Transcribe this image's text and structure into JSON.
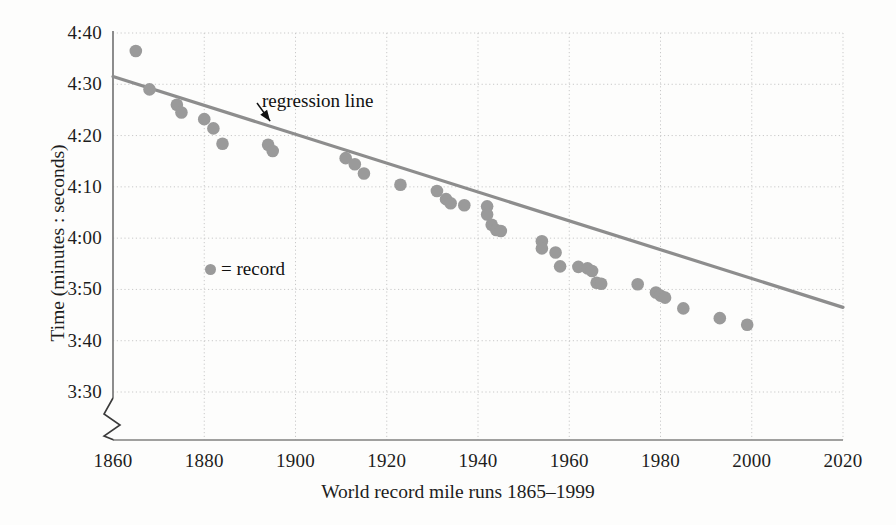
{
  "chart_data": {
    "type": "scatter",
    "title": "",
    "xlabel": "World record mile runs 1865–1999",
    "ylabel": "Time (minutes : seconds)",
    "xlim": [
      1860,
      2020
    ],
    "ylim_seconds": [
      210,
      280
    ],
    "xticks": [
      1860,
      1880,
      1900,
      1920,
      1940,
      1960,
      1980,
      2000,
      2020
    ],
    "yticks": [
      "3:30",
      "3:40",
      "3:50",
      "4:00",
      "4:10",
      "4:20",
      "4:30",
      "4:40"
    ],
    "ytick_seconds": [
      210,
      220,
      230,
      240,
      250,
      260,
      270,
      280
    ],
    "grid": true,
    "y_axis_break": true,
    "legend": {
      "position": "inside-left",
      "marker": "filled-circle",
      "entries": [
        {
          "label": "= record",
          "color": "#9a9a9a"
        }
      ]
    },
    "annotations": [
      {
        "text": "regression line",
        "x": 1920,
        "y_seconds": 266,
        "arrow_to_x": 1894,
        "arrow_to_y_seconds": 263
      }
    ],
    "series": [
      {
        "name": "record",
        "color": "#9a9a9a",
        "marker": "circle",
        "points": [
          {
            "x": 1865,
            "time": "4:36.5",
            "seconds": 276.5
          },
          {
            "x": 1868,
            "time": "4:29.0",
            "seconds": 269.0
          },
          {
            "x": 1874,
            "time": "4:26.0",
            "seconds": 266.0
          },
          {
            "x": 1875,
            "time": "4:24.5",
            "seconds": 264.5
          },
          {
            "x": 1880,
            "time": "4:23.2",
            "seconds": 263.2
          },
          {
            "x": 1882,
            "time": "4:21.4",
            "seconds": 261.4
          },
          {
            "x": 1884,
            "time": "4:18.4",
            "seconds": 258.4
          },
          {
            "x": 1894,
            "time": "4:18.2",
            "seconds": 258.2
          },
          {
            "x": 1895,
            "time": "4:17.0",
            "seconds": 257.0
          },
          {
            "x": 1911,
            "time": "4:15.6",
            "seconds": 255.6
          },
          {
            "x": 1913,
            "time": "4:14.4",
            "seconds": 254.4
          },
          {
            "x": 1915,
            "time": "4:12.6",
            "seconds": 252.6
          },
          {
            "x": 1923,
            "time": "4:10.4",
            "seconds": 250.4
          },
          {
            "x": 1931,
            "time": "4:09.2",
            "seconds": 249.2
          },
          {
            "x": 1933,
            "time": "4:07.6",
            "seconds": 247.6
          },
          {
            "x": 1934,
            "time": "4:06.8",
            "seconds": 246.8
          },
          {
            "x": 1937,
            "time": "4:06.4",
            "seconds": 246.4
          },
          {
            "x": 1942,
            "time": "4:06.2",
            "seconds": 246.2
          },
          {
            "x": 1942,
            "time": "4:04.6",
            "seconds": 244.6
          },
          {
            "x": 1943,
            "time": "4:02.6",
            "seconds": 242.6
          },
          {
            "x": 1944,
            "time": "4:01.6",
            "seconds": 241.6
          },
          {
            "x": 1945,
            "time": "4:01.4",
            "seconds": 241.4
          },
          {
            "x": 1954,
            "time": "3:59.4",
            "seconds": 239.4
          },
          {
            "x": 1954,
            "time": "3:58.0",
            "seconds": 238.0
          },
          {
            "x": 1957,
            "time": "3:57.2",
            "seconds": 237.2
          },
          {
            "x": 1958,
            "time": "3:54.5",
            "seconds": 234.5
          },
          {
            "x": 1962,
            "time": "3:54.4",
            "seconds": 234.4
          },
          {
            "x": 1964,
            "time": "3:54.1",
            "seconds": 234.1
          },
          {
            "x": 1965,
            "time": "3:53.6",
            "seconds": 233.6
          },
          {
            "x": 1966,
            "time": "3:51.3",
            "seconds": 231.3
          },
          {
            "x": 1967,
            "time": "3:51.1",
            "seconds": 231.1
          },
          {
            "x": 1975,
            "time": "3:51.0",
            "seconds": 231.0
          },
          {
            "x": 1979,
            "time": "3:49.4",
            "seconds": 229.4
          },
          {
            "x": 1980,
            "time": "3:48.8",
            "seconds": 228.8
          },
          {
            "x": 1981,
            "time": "3:48.4",
            "seconds": 228.4
          },
          {
            "x": 1985,
            "time": "3:46.3",
            "seconds": 226.3
          },
          {
            "x": 1993,
            "time": "3:44.4",
            "seconds": 224.4
          },
          {
            "x": 1999,
            "time": "3:43.1",
            "seconds": 223.1
          }
        ]
      }
    ],
    "regression_line": {
      "color": "#8d8d8d",
      "x_start": 1860,
      "y_start_seconds": 271.5,
      "x_end": 2020,
      "y_end_seconds": 226.5
    }
  },
  "colors": {
    "marker": "#9a9a9a",
    "regression": "#8d8d8d",
    "grid": "#c9c9c9",
    "axis": "#808080",
    "text": "#1d1d1d",
    "background": "#fdfdfc"
  }
}
